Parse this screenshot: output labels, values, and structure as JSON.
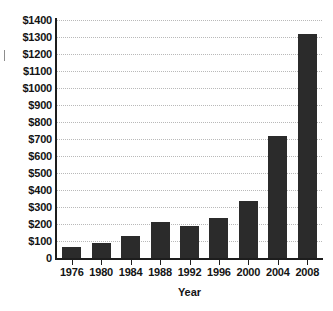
{
  "chart_data": {
    "type": "bar",
    "title": "",
    "subtitle": "",
    "xlabel": "Year",
    "ylabel": "",
    "categories": [
      "1976",
      "1980",
      "1984",
      "1988",
      "1992",
      "1996",
      "2000",
      "2004",
      "2008"
    ],
    "values": [
      65,
      88,
      132,
      212,
      188,
      235,
      338,
      715,
      1315
    ],
    "ylim": [
      0,
      1400
    ],
    "ytick_values": [
      0,
      100,
      200,
      300,
      400,
      500,
      600,
      700,
      800,
      900,
      1000,
      1100,
      1200,
      1300,
      1400
    ],
    "ytick_labels": [
      "0",
      "$100",
      "$200",
      "$300",
      "$400",
      "$500",
      "$600",
      "$700",
      "$800",
      "$900",
      "$1000",
      "$1100",
      "$1200",
      "$1300",
      "$1400"
    ],
    "grid": true,
    "grid_axis": "y",
    "grid_style": "dotted",
    "legend": false,
    "legend_position": "none",
    "bar_color": "#2b2b2b",
    "grid_color": "#b9b9b9",
    "axis_color": "#1d1d1d",
    "text_color": "#141414",
    "background_color": "#ffffff",
    "annotations": []
  }
}
